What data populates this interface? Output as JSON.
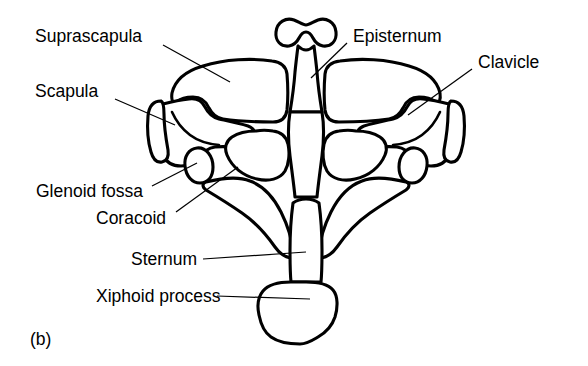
{
  "figure": {
    "caption": "(b)",
    "caption_x": 30,
    "caption_y": 331,
    "background_color": "#ffffff",
    "line_color": "#000000"
  },
  "labels": [
    {
      "id": "suprascapula",
      "text": "Suprascapula",
      "x": 35,
      "y": 28,
      "align": "left",
      "leader": {
        "x1": 163,
        "y1": 45,
        "x2": 230,
        "y2": 82
      }
    },
    {
      "id": "scapula",
      "text": "Scapula",
      "x": 35,
      "y": 83,
      "align": "left",
      "leader": {
        "x1": 115,
        "y1": 99,
        "x2": 175,
        "y2": 125
      }
    },
    {
      "id": "episternum",
      "text": "Episternum",
      "x": 353,
      "y": 28,
      "align": "left",
      "leader": {
        "x1": 347,
        "y1": 43,
        "x2": 311,
        "y2": 78
      }
    },
    {
      "id": "clavicle",
      "text": "Clavicle",
      "x": 478,
      "y": 54,
      "align": "left",
      "leader": {
        "x1": 472,
        "y1": 69,
        "x2": 408,
        "y2": 115
      }
    },
    {
      "id": "glenoid-fossa",
      "text": "Glenoid fossa",
      "x": 36,
      "y": 183,
      "align": "left",
      "leader": {
        "x1": 152,
        "y1": 186,
        "x2": 197,
        "y2": 163
      }
    },
    {
      "id": "coracoid",
      "text": "Coracoid",
      "x": 96,
      "y": 210,
      "align": "left",
      "leader": {
        "x1": 176,
        "y1": 212,
        "x2": 238,
        "y2": 167
      }
    },
    {
      "id": "sternum",
      "text": "Sternum",
      "x": 131,
      "y": 251,
      "align": "left",
      "leader": {
        "x1": 203,
        "y1": 259,
        "x2": 306,
        "y2": 252
      }
    },
    {
      "id": "xiphoid-process",
      "text": "Xiphoid process",
      "x": 96,
      "y": 288,
      "align": "left",
      "leader": {
        "x1": 217,
        "y1": 296,
        "x2": 310,
        "y2": 299
      }
    }
  ]
}
